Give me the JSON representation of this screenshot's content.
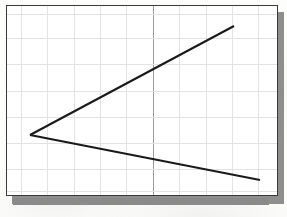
{
  "document": {
    "kind": "scanned-chart",
    "background_color": "#fdfdfc"
  },
  "chart_frame": {
    "border_color": "#3a3a3a",
    "plot_background": "#ffffff",
    "shadow_color": "#8e8e8e",
    "grid_color": "#e3e3e3",
    "axis_color": "#9a9a9a",
    "line_color": "#1a1a1a"
  },
  "chart_data": {
    "type": "line",
    "title": "",
    "subtitle": "",
    "xlabel": "",
    "ylabel": "",
    "xlim": [
      0,
      10
    ],
    "ylim": [
      0,
      10
    ],
    "grid": true,
    "legend": "none",
    "x_ticks": [
      0,
      1,
      2,
      3,
      4,
      5,
      6,
      7,
      8,
      9,
      10
    ],
    "y_ticks": [
      0,
      1,
      2,
      3,
      4,
      5,
      6,
      7,
      8,
      9,
      10
    ],
    "x_tick_labels": [
      "",
      "",
      "",
      "",
      "",
      "",
      "",
      "",
      "",
      "",
      ""
    ],
    "y_tick_labels": [
      "",
      "",
      "",
      "",
      "",
      "",
      "",
      "",
      "",
      "",
      ""
    ],
    "annotations": [],
    "vertical_reference_line": {
      "x": 5.3,
      "style": "solid",
      "color": "#9a9a9a"
    },
    "series": [
      {
        "name": "upper-branch",
        "color": "#1a1a1a",
        "x": [
          0.9,
          8.5
        ],
        "values": [
          3.3,
          8.9
        ]
      },
      {
        "name": "lower-branch",
        "color": "#1a1a1a",
        "x": [
          0.9,
          9.6
        ],
        "values": [
          3.3,
          0.9
        ]
      }
    ],
    "vertex_point": {
      "x": 0.9,
      "y": 3.3,
      "label": ""
    }
  },
  "grid_layout": {
    "vertical_positions_px": [
      14,
      40,
      67,
      93,
      119,
      146,
      172,
      199,
      225,
      251
    ],
    "horizontal_positions_px": [
      8,
      32,
      58,
      85,
      111,
      137,
      163,
      185
    ],
    "axis_position_px": 146
  },
  "line_geometry_px": {
    "vertex": {
      "x": 23,
      "y": 129
    },
    "upper_end": {
      "x": 227,
      "y": 20
    },
    "lower_end": {
      "x": 253,
      "y": 174
    },
    "stroke_width": 2.1
  }
}
